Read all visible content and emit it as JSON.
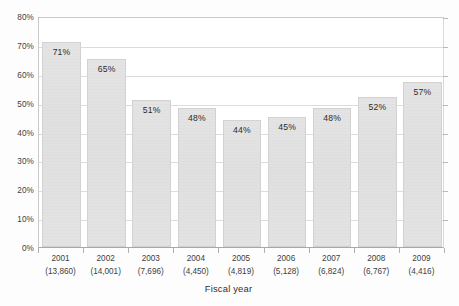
{
  "chart_data": {
    "type": "bar",
    "title": "",
    "subtitle": "",
    "xlabel": "Fiscal year",
    "ylabel": "",
    "categories": [
      "2001",
      "2002",
      "2003",
      "2004",
      "2005",
      "2006",
      "2007",
      "2008",
      "2009"
    ],
    "category_sublabels": [
      "(13,860)",
      "(14,001)",
      "(7,696)",
      "(4,450)",
      "(4,819)",
      "(5,128)",
      "(6,824)",
      "(6,767)",
      "(4,416)"
    ],
    "values": [
      71,
      65,
      51,
      48,
      44,
      45,
      48,
      52,
      57
    ],
    "data_labels": [
      "71%",
      "65%",
      "51%",
      "48%",
      "44%",
      "45%",
      "48%",
      "52%",
      "57%"
    ],
    "ylim": [
      0,
      80
    ],
    "ytick_values": [
      0,
      10,
      20,
      30,
      40,
      50,
      60,
      70,
      80
    ],
    "ytick_labels": [
      "0%",
      "10%",
      "20%",
      "30%",
      "40%",
      "50%",
      "60%",
      "70%",
      "80%"
    ],
    "grid": true,
    "legend": false,
    "legend_position": "none",
    "bar_color": "#e2e2e2",
    "bar_border_color": "#d2d2d2",
    "gridline_color": "#dcdcdc",
    "axis_color": "#a8a8a8",
    "text_color": "#3d3d3d",
    "background_color": "#ffffff"
  }
}
